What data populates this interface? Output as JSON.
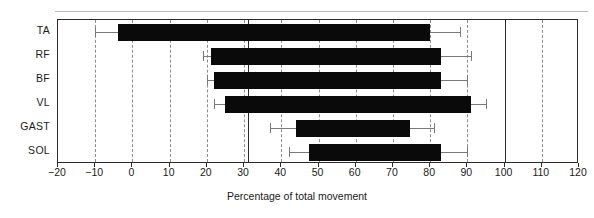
{
  "chart_data": {
    "type": "bar",
    "orientation": "horizontal",
    "title": "",
    "xlabel": "Percentage of total movement",
    "ylabel": "",
    "xlim": [
      -20,
      120
    ],
    "xticks": [
      -20,
      -10,
      0,
      10,
      20,
      30,
      40,
      50,
      60,
      70,
      80,
      90,
      100,
      110,
      120
    ],
    "xticklabels": [
      "−20",
      "−10",
      "0",
      "10",
      "20",
      "30",
      "40",
      "50",
      "60",
      "70",
      "80",
      "90",
      "100",
      "110",
      "120"
    ],
    "grid": "dashed vertical gridlines at every tick",
    "reference_lines": [
      31,
      100
    ],
    "categories": [
      "TA",
      "RF",
      "BF",
      "VL",
      "GAST",
      "SOL"
    ],
    "bar_color": "#0a0a0a",
    "errorbar_color": "#7a7a7a",
    "note": "Floating horizontal range bars: each bar spans from onset to offset as percentage of total movement, with error bars at both ends.",
    "bars": [
      {
        "category": "TA",
        "start": -4,
        "end": 80,
        "start_err_low": -10,
        "start_err_high": -4,
        "end_err_low": 80,
        "end_err_high": 88
      },
      {
        "category": "RF",
        "start": 21,
        "end": 83,
        "start_err_low": 19,
        "start_err_high": 21,
        "end_err_low": 83,
        "end_err_high": 91
      },
      {
        "category": "BF",
        "start": 22,
        "end": 83,
        "start_err_low": 20,
        "start_err_high": 22,
        "end_err_low": 83,
        "end_err_high": 90
      },
      {
        "category": "VL",
        "start": 25,
        "end": 91,
        "start_err_low": 22,
        "start_err_high": 25,
        "end_err_low": 91,
        "end_err_high": 95
      },
      {
        "category": "GAST",
        "start": 44,
        "end": 74.5,
        "start_err_low": 37,
        "start_err_high": 44,
        "end_err_low": 74.5,
        "end_err_high": 81
      },
      {
        "category": "SOL",
        "start": 47.5,
        "end": 83,
        "start_err_low": 42,
        "start_err_high": 47.5,
        "end_err_low": 83,
        "end_err_high": 90
      }
    ]
  }
}
